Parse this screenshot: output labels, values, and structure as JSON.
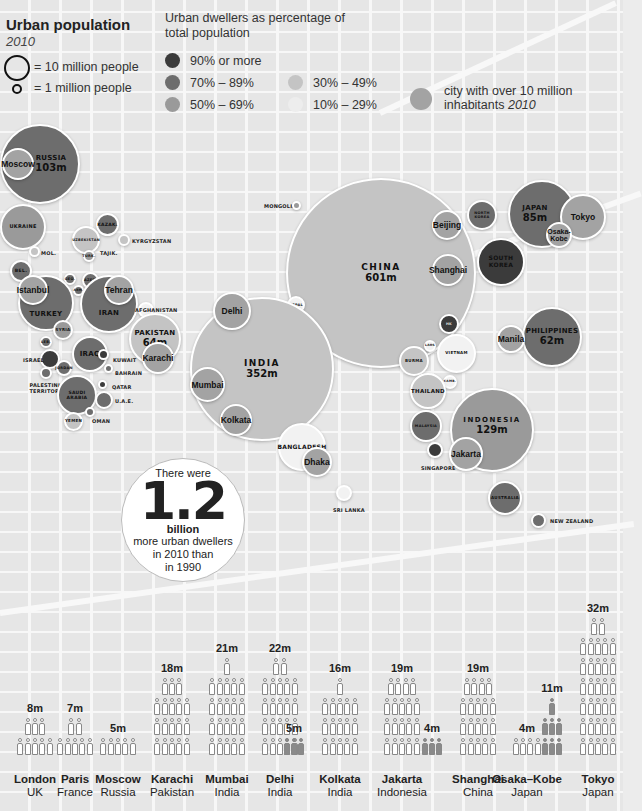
{
  "legend": {
    "title": "Urban population",
    "year": "2010",
    "scale_big": "= 10 million people",
    "scale_small": "= 1 million people",
    "pct_title": "Urban dwellers as percentage of total population",
    "categories": [
      {
        "label": "90% or more",
        "color": "#3b3b3b"
      },
      {
        "label": "70% – 89%",
        "color": "#6d6d6d"
      },
      {
        "label": "50% – 69%",
        "color": "#9a9a9a"
      },
      {
        "label": "30% – 49%",
        "color": "#c4c4c4"
      },
      {
        "label": "10% – 29%",
        "color": "#ededed"
      }
    ],
    "city_marker_label": "city with over 10 million inhabitants",
    "city_marker_year": "2010",
    "city_marker_color": "#a3a3a3"
  },
  "callout": {
    "line1": "There were",
    "number": "1.2",
    "unit": "billion",
    "line3": "more urban dwellers",
    "line4": "in 2010 than",
    "line5": "in 1990"
  },
  "countries": [
    {
      "name": "RUSSIA",
      "value": "103m"
    },
    {
      "name": "UKRAINE"
    },
    {
      "name": "MOL."
    },
    {
      "name": "KAZAK."
    },
    {
      "name": "UZBEKISTAN"
    },
    {
      "name": "KYRGYZSTAN"
    },
    {
      "name": "TURK."
    },
    {
      "name": "TAJIK."
    },
    {
      "name": "BEL."
    },
    {
      "name": "GEO."
    },
    {
      "name": "AZER."
    },
    {
      "name": "ARM."
    },
    {
      "name": "TURKEY"
    },
    {
      "name": "IRAN"
    },
    {
      "name": "AFGHANISTAN"
    },
    {
      "name": "PAKISTAN",
      "value": "64m"
    },
    {
      "name": "SYRIA"
    },
    {
      "name": "LEB."
    },
    {
      "name": "IRAQ"
    },
    {
      "name": "ISRAEL"
    },
    {
      "name": "JORDAN"
    },
    {
      "name": "KUWAIT"
    },
    {
      "name": "BAHRAIN"
    },
    {
      "name": "PALESTINIAN TERRITORIES"
    },
    {
      "name": "SAUDI ARABIA"
    },
    {
      "name": "QATAR"
    },
    {
      "name": "U.A.E."
    },
    {
      "name": "YEMEN"
    },
    {
      "name": "OMAN"
    },
    {
      "name": "MONGOLIA"
    },
    {
      "name": "CHINA",
      "value": "601m"
    },
    {
      "name": "NEPAL"
    },
    {
      "name": "INDIA",
      "value": "352m"
    },
    {
      "name": "BANGLADESH"
    },
    {
      "name": "SRI LANKA"
    },
    {
      "name": "NORTH KOREA"
    },
    {
      "name": "SOUTH KOREA"
    },
    {
      "name": "JAPAN",
      "value": "85m"
    },
    {
      "name": "PHILIPPINES",
      "value": "62m"
    },
    {
      "name": "HK"
    },
    {
      "name": "LAOS"
    },
    {
      "name": "VIETNAM"
    },
    {
      "name": "BURMA"
    },
    {
      "name": "CAMB."
    },
    {
      "name": "THAILAND"
    },
    {
      "name": "MALAYSIA"
    },
    {
      "name": "SINGAPORE"
    },
    {
      "name": "INDONESIA",
      "value": "129m"
    },
    {
      "name": "AUSTRALIA"
    },
    {
      "name": "NEW ZEALAND"
    }
  ],
  "cities": [
    "Moscow",
    "Istanbul",
    "Tehran",
    "Karachi",
    "Delhi",
    "Mumbai",
    "Kolkata",
    "Dhaka",
    "Beijing",
    "Shanghai",
    "Tokyo",
    "Osaka-Kobe",
    "Manila",
    "Jakarta"
  ],
  "chart_data": [
    {
      "type": "bubble-map",
      "title": "Urban population 2010",
      "size_legend": {
        "large": "10 million people",
        "small": "1 million people"
      },
      "color_legend": [
        "90% or more",
        "70% – 89%",
        "50% – 69%",
        "30% – 49%",
        "10% – 29%"
      ],
      "labeled_values": [
        {
          "country": "China",
          "urban_population_m": 601
        },
        {
          "country": "India",
          "urban_population_m": 352
        },
        {
          "country": "Indonesia",
          "urban_population_m": 129
        },
        {
          "country": "Russia",
          "urban_population_m": 103
        },
        {
          "country": "Japan",
          "urban_population_m": 85
        },
        {
          "country": "Pakistan",
          "urban_population_m": 64
        },
        {
          "country": "Philippines",
          "urban_population_m": 62
        }
      ]
    },
    {
      "type": "bar",
      "title": "City population 1990 vs 2010 (pictogram)",
      "categories": [
        "London UK",
        "Paris France",
        "Moscow Russia",
        "Karachi Pakistan",
        "Mumbai India",
        "Delhi India",
        "Kolkata India",
        "Jakarta Indonesia",
        "Shanghai China",
        "Osaka–Kobe Japan",
        "Tokyo Japan"
      ],
      "series": [
        {
          "name": "Population label (m)",
          "values": [
            8,
            7,
            5,
            18,
            21,
            22,
            16,
            19,
            19,
            4,
            32
          ]
        },
        {
          "name": "Comparison label (m)",
          "values": [
            null,
            null,
            null,
            null,
            null,
            null,
            5,
            null,
            4,
            null,
            11
          ]
        }
      ],
      "unit": "million"
    }
  ],
  "pictograms": [
    {
      "city": "London",
      "country": "UK",
      "label": "8m"
    },
    {
      "city": "Paris",
      "country": "France",
      "label": "7m"
    },
    {
      "city": "Moscow",
      "country": "Russia",
      "label": "5m"
    },
    {
      "city": "Karachi",
      "country": "Pakistan",
      "label": "18m"
    },
    {
      "city": "Mumbai",
      "country": "India",
      "label": "21m"
    },
    {
      "city": "Delhi",
      "country": "India",
      "label": "22m"
    },
    {
      "city": "Kolkata",
      "country": "India",
      "label": "16m",
      "side_label": "5m"
    },
    {
      "city": "Jakarta",
      "country": "Indonesia",
      "label": "19m"
    },
    {
      "city": "Shanghai",
      "country": "China",
      "label": "19m",
      "side_label": "4m"
    },
    {
      "city": "Osaka–Kobe",
      "country": "Japan",
      "label": "4m"
    },
    {
      "city": "Tokyo",
      "country": "Japan",
      "label": "32m",
      "side_label": "11m"
    }
  ]
}
